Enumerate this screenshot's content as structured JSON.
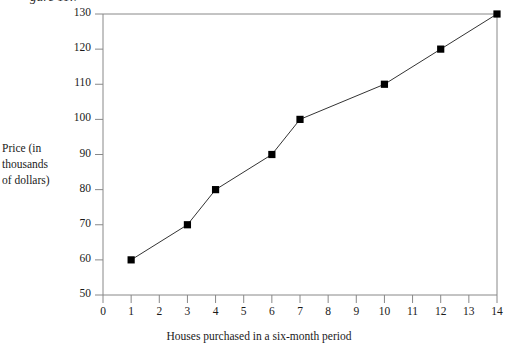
{
  "figure": {
    "clipped_caption": "gure 11.7",
    "marker_shape": "square",
    "line_color": "#333333",
    "marker_color": "#000000",
    "frame_color": "#888888",
    "background": "#ffffff"
  },
  "chart_data": {
    "type": "line",
    "title": "",
    "subtitle": "",
    "xlabel": "Houses purchased in a six-month period",
    "ylabel": "Price (in thousands of dollars)",
    "ylabel_lines": [
      "Price (in",
      "thousands",
      "of dollars)"
    ],
    "x": [
      1,
      3,
      4,
      6,
      7,
      10,
      12,
      14
    ],
    "values": [
      60,
      70,
      80,
      90,
      100,
      110,
      120,
      130
    ],
    "points": [
      {
        "x": 1,
        "y": 60
      },
      {
        "x": 3,
        "y": 70
      },
      {
        "x": 4,
        "y": 80
      },
      {
        "x": 6,
        "y": 90
      },
      {
        "x": 7,
        "y": 100
      },
      {
        "x": 10,
        "y": 110
      },
      {
        "x": 12,
        "y": 120
      },
      {
        "x": 14,
        "y": 130
      }
    ],
    "xlim": [
      0,
      14
    ],
    "ylim": [
      50,
      130
    ],
    "xticks": [
      0,
      1,
      2,
      3,
      4,
      5,
      6,
      7,
      8,
      9,
      10,
      11,
      12,
      13,
      14
    ],
    "yticks": [
      50,
      60,
      70,
      80,
      90,
      100,
      110,
      120,
      130
    ],
    "xtick_labels": [
      "0",
      "1",
      "2",
      "3",
      "4",
      "5",
      "6",
      "7",
      "8",
      "9",
      "10",
      "11",
      "12",
      "13",
      "14"
    ],
    "ytick_labels": [
      "50",
      "60",
      "70",
      "80",
      "90",
      "100",
      "110",
      "120",
      "130"
    ],
    "grid": false,
    "legend": null,
    "legend_position": "none",
    "annotations": []
  }
}
